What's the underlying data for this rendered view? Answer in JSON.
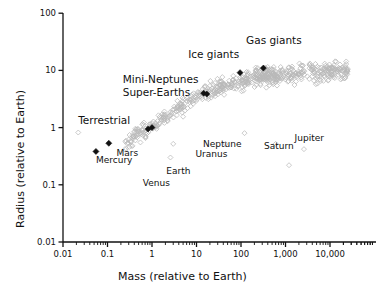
{
  "chart_data": {
    "type": "scatter",
    "title": "",
    "xlabel": "Mass (relative to Earth)",
    "ylabel": "Radius (relative to Earth)",
    "xscale": "log",
    "yscale": "log",
    "xlim": [
      0.01,
      50000
    ],
    "ylim": [
      0.01,
      100
    ],
    "grid": false,
    "legend": "none",
    "xticks": [
      "0.01",
      "0.1",
      "1",
      "10",
      "100",
      "1,000",
      "10,000"
    ],
    "xtick_values": [
      0.01,
      0.1,
      1,
      10,
      100,
      1000,
      10000
    ],
    "yticks": [
      "0.01",
      "0.1",
      "1",
      "10",
      "100"
    ],
    "ytick_values": [
      0.01,
      0.1,
      1,
      10,
      100
    ],
    "minor_ticks": true,
    "series": [
      {
        "name": "Exoplanets",
        "marker": "open-diamond",
        "color": "#b8b8b8",
        "count": 620,
        "note": "open diamond markers, light gray, dense band rising from lower-left to upper-right"
      },
      {
        "name": "Solar System planets",
        "marker": "filled-diamond",
        "color": "#111111",
        "points": [
          {
            "label": "Mercury",
            "mass": 0.055,
            "radius": 0.383
          },
          {
            "label": "Mars",
            "mass": 0.107,
            "radius": 0.532
          },
          {
            "label": "Venus",
            "mass": 0.815,
            "radius": 0.949
          },
          {
            "label": "Earth",
            "mass": 1.0,
            "radius": 1.0
          },
          {
            "label": "Uranus",
            "mass": 14.5,
            "radius": 3.98
          },
          {
            "label": "Neptune",
            "mass": 17.1,
            "radius": 3.86
          },
          {
            "label": "Saturn",
            "mass": 95.2,
            "radius": 9.14
          },
          {
            "label": "Jupiter",
            "mass": 317.8,
            "radius": 10.97
          }
        ]
      }
    ],
    "annotations": [
      {
        "text": "Terrestrial",
        "x": 0.022,
        "y": 1.35,
        "kind": "group"
      },
      {
        "text": "Super-Earths",
        "x": 0.22,
        "y": 4.2,
        "kind": "group"
      },
      {
        "text": "Mini-Neptunes",
        "x": 0.22,
        "y": 7.0,
        "kind": "group"
      },
      {
        "text": "Ice giants",
        "x": 6.5,
        "y": 19.0,
        "kind": "group"
      },
      {
        "text": "Gas giants",
        "x": 130,
        "y": 34.0,
        "kind": "group"
      },
      {
        "text": "Mercury",
        "x": 0.055,
        "y": 0.26,
        "kind": "planet"
      },
      {
        "text": "Mars",
        "x": 0.16,
        "y": 0.35,
        "kind": "planet"
      },
      {
        "text": "Venus",
        "x": 0.62,
        "y": 0.105,
        "kind": "planet"
      },
      {
        "text": "Earth",
        "x": 2.1,
        "y": 0.165,
        "kind": "planet"
      },
      {
        "text": "Uranus",
        "x": 9.5,
        "y": 0.33,
        "kind": "planet"
      },
      {
        "text": "Neptune",
        "x": 14.0,
        "y": 0.49,
        "kind": "planet"
      },
      {
        "text": "Saturn",
        "x": 330,
        "y": 0.45,
        "kind": "planet"
      },
      {
        "text": "Jupiter",
        "x": 1600,
        "y": 0.62,
        "kind": "planet"
      }
    ]
  },
  "axes": {
    "x_title": "Mass (relative to Earth)",
    "y_title": "Radius (relative to Earth)"
  },
  "labels": {
    "terrestrial": "Terrestrial",
    "super_earths": "Super-Earths",
    "mini_neptunes": "Mini-Neptunes",
    "ice_giants": "Ice giants",
    "gas_giants": "Gas giants",
    "mercury": "Mercury",
    "mars": "Mars",
    "venus": "Venus",
    "earth": "Earth",
    "uranus": "Uranus",
    "neptune": "Neptune",
    "saturn": "Saturn",
    "jupiter": "Jupiter"
  },
  "xtick_labels": [
    "0.01",
    "0.1",
    "1",
    "10",
    "100",
    "1,000",
    "10,000"
  ],
  "ytick_labels": [
    "100",
    "10",
    "1",
    "0.1",
    "0.01"
  ],
  "colors": {
    "axis": "#111111",
    "exoplanet_marker": "#b9b9b9",
    "solar_marker": "#111111",
    "background": "#ffffff"
  }
}
